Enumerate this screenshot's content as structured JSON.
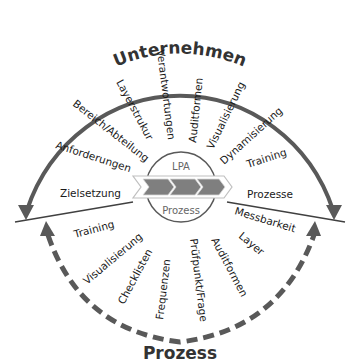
{
  "diagram": {
    "top_title": "Unternehmen",
    "bottom_title": "Prozess",
    "center": {
      "top_label": "LPA",
      "bottom_label": "Prozess"
    },
    "top_items": [
      {
        "label": "Zielsetzung"
      },
      {
        "label": "Anforderungen"
      },
      {
        "label": "Bereich/Abteilung"
      },
      {
        "label": "Layerstrukur"
      },
      {
        "label": "Verantwortungen"
      },
      {
        "label": "Auditformen"
      },
      {
        "label": "Visualisierung"
      },
      {
        "label": "Dynamisierung"
      },
      {
        "label": "Training"
      },
      {
        "label": "Prozesse"
      }
    ],
    "bottom_items": [
      {
        "label": "Training"
      },
      {
        "label": "Visualisierung"
      },
      {
        "label": "Checklisten"
      },
      {
        "label": "Frequenzen"
      },
      {
        "label": "Prüfpunkt/Frage"
      },
      {
        "label": "Auditformen"
      },
      {
        "label": "Layer"
      },
      {
        "label": "Messbarkeit"
      }
    ]
  },
  "colors": {
    "arc": "#595959",
    "line": "#404040",
    "chevron_fill": "#7f7f7f",
    "chevron_outline": "#bfbfbf",
    "text": "#1a1a1a",
    "center_text": "#666666"
  }
}
